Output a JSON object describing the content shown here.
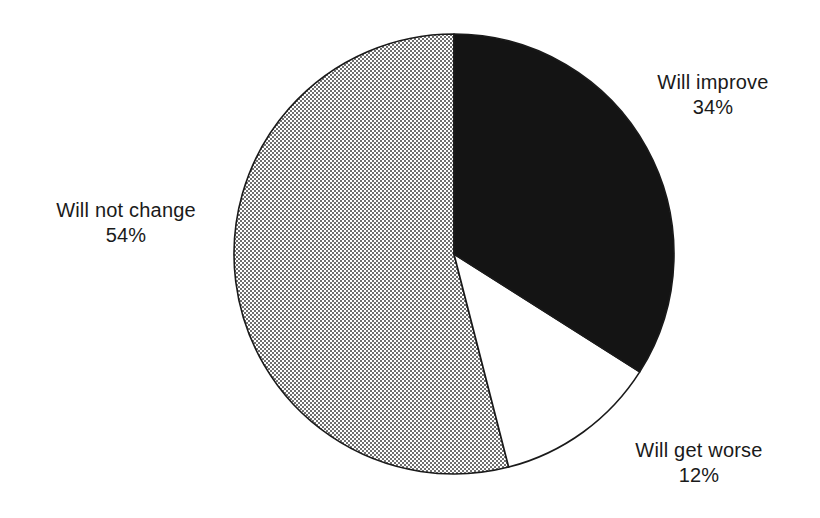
{
  "chart_data": {
    "type": "pie",
    "title": "",
    "subtitle": "",
    "xlabel": "",
    "ylabel": "",
    "legend_position": "none",
    "grid": false,
    "labels_inline": true,
    "start_angle_deg": 0,
    "direction": "clockwise",
    "categories": [
      "Will improve",
      "Will not change",
      "Will get worse"
    ],
    "values": [
      34,
      54,
      12
    ],
    "value_unit": "%",
    "slices": [
      {
        "label": "Will improve",
        "value": 34,
        "value_text": "34%",
        "fill": "#141414",
        "fill_style": "solid-black",
        "start_deg": 0,
        "end_deg": 122.4
      },
      {
        "label": "Will not change",
        "value": 54,
        "value_text": "54%",
        "fill": "#a0a0a0",
        "fill_style": "checkerboard-halftone",
        "start_deg": 165.6,
        "end_deg": 360
      },
      {
        "label": "Will get worse",
        "value": 12,
        "value_text": "12%",
        "fill": "#ffffff",
        "fill_style": "solid-white",
        "start_deg": 122.4,
        "end_deg": 165.6
      }
    ],
    "geometry": {
      "center_x": 454,
      "center_y": 254,
      "radius": 220,
      "stroke": "#1a1a1a",
      "stroke_width": 1.6
    },
    "colors": {
      "background": "#ffffff",
      "text": "#1a1a1a",
      "outline": "#1a1a1a",
      "black_slice": "#141414",
      "gray_slice": "#a0a0a0",
      "white_slice": "#ffffff"
    }
  },
  "labels": {
    "improve": {
      "name": "Will improve",
      "value": "34%"
    },
    "not_change": {
      "name": "Will not change",
      "value": "54%"
    },
    "get_worse": {
      "name": "Will get worse",
      "value": "12%"
    }
  }
}
